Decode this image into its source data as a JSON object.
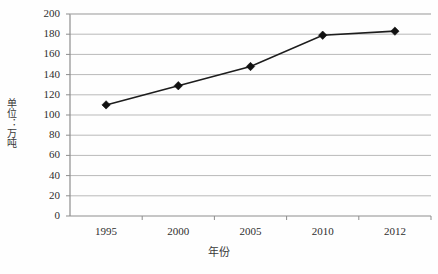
{
  "chart_data": {
    "type": "line",
    "title": "",
    "subtitle": "",
    "xlabel": "年份",
    "ylabel": "单位：万吨",
    "categories": [
      "1995",
      "2000",
      "2005",
      "2010",
      "2012"
    ],
    "values": [
      110,
      129,
      148,
      179,
      183
    ],
    "series": [
      {
        "name": "",
        "values": [
          110,
          129,
          148,
          179,
          183
        ]
      }
    ],
    "ylim": [
      0,
      200
    ],
    "y_ticks": [
      0,
      20,
      40,
      60,
      80,
      100,
      120,
      140,
      160,
      180,
      200
    ],
    "y_tick_labels": [
      "0",
      "20",
      "40",
      "60",
      "80",
      "100",
      "120",
      "140",
      "160",
      "180",
      "200"
    ],
    "x_tick_labels": [
      "1995",
      "2000",
      "2005",
      "2010",
      "2012"
    ],
    "grid": true,
    "grid_axis": "y",
    "legend": false,
    "legend_position": "none",
    "marker": "diamond",
    "line_color": "#1d1d1d",
    "marker_color": "#111111",
    "grid_color": "#b9b9b9",
    "axis_color": "#8d8d8d",
    "background_color": "#fefefe"
  },
  "axes": {
    "y_title": "单位：万吨",
    "x_title": "年份"
  }
}
